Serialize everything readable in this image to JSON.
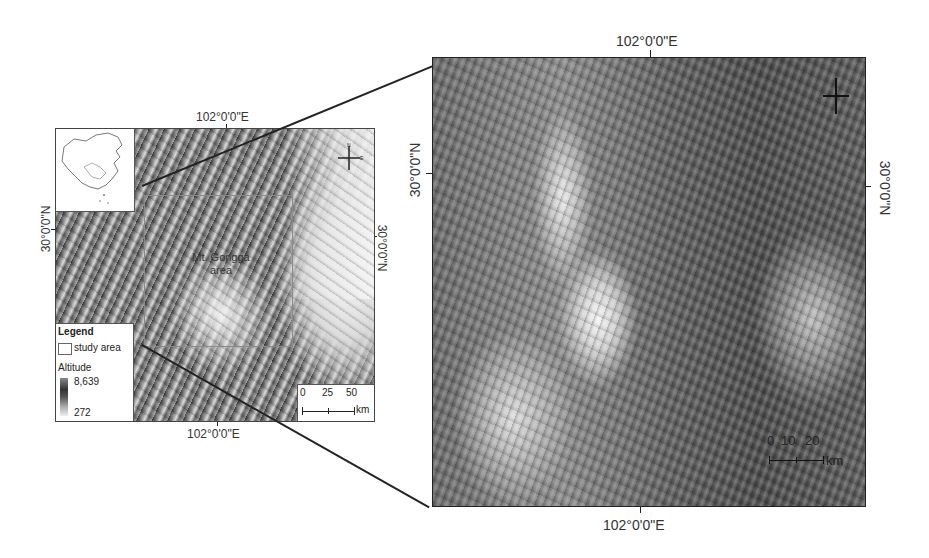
{
  "figure": {
    "type": "study-area location map",
    "colors": {
      "frame": "#222222",
      "background": "#ffffff",
      "study_box": "#8a8a8a"
    }
  },
  "overview_map": {
    "top_longitude_label": "102°0'0\"E",
    "bottom_longitude_label": "102°0'0\"E",
    "left_latitude_label": "30°0'0\"N",
    "right_latitude_label": "30°0'0\"N",
    "area_label_line1": "Mt. Gongga",
    "area_label_line2": "area",
    "inset": "china-outline-inset",
    "north_arrow": {
      "n": "N",
      "e": "E",
      "s": "S",
      "w": "W"
    },
    "legend": {
      "title": "Legend",
      "study_area_label": "study area",
      "altitude_title": "Altitude",
      "altitude_max": "8,639",
      "altitude_min": "272"
    },
    "scale_bar": {
      "ticks": [
        "0",
        "25",
        "50"
      ],
      "unit": "km"
    }
  },
  "detail_map": {
    "top_longitude_label": "102°0'0\"E",
    "bottom_longitude_label": "102°0'0\"E",
    "left_latitude_label": "30°0'0\"N",
    "right_latitude_label": "30°0'0\"N",
    "scale_bar": {
      "ticks": [
        "0",
        "10",
        "20"
      ],
      "unit": "km"
    },
    "north_arrow": "compass-cross"
  }
}
